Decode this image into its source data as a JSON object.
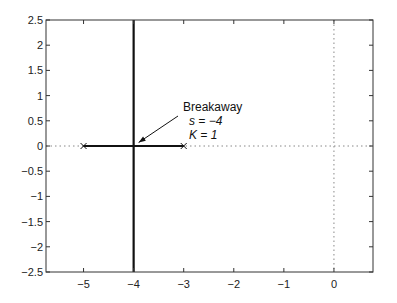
{
  "chart_data": {
    "type": "line",
    "title": "",
    "xlabel": "",
    "ylabel": "",
    "xlim": [
      -5.75,
      0.78
    ],
    "ylim": [
      -2.5,
      2.5
    ],
    "grid": false,
    "x_ticks": [
      -5,
      -4,
      -3,
      -2,
      -1,
      0
    ],
    "x_tick_labels": [
      "−5",
      "−4",
      "−3",
      "−2",
      "−1",
      "0"
    ],
    "y_ticks": [
      2.5,
      2,
      1.5,
      1,
      0.5,
      0,
      -0.5,
      -1,
      -1.5,
      -2,
      -2.5
    ],
    "y_tick_labels": [
      "2.5",
      "2",
      "1.5",
      "1",
      "0.5",
      "0",
      "−0.5",
      "−1",
      "−1.5",
      "−2",
      "−2.5"
    ],
    "series": [
      {
        "name": "root locus real-axis segment",
        "x": [
          -5,
          -3
        ],
        "y": [
          0,
          0
        ],
        "style": "solid-thick"
      },
      {
        "name": "root locus vertical asymptote branch",
        "x": [
          -4,
          -4
        ],
        "y": [
          -2.5,
          2.5
        ],
        "style": "solid-thick"
      }
    ],
    "open_loop_poles": [
      {
        "x": -5,
        "y": 0,
        "marker": "x"
      },
      {
        "x": -3,
        "y": 0,
        "marker": "x"
      }
    ],
    "reference_lines": [
      {
        "orientation": "horizontal",
        "value": 0,
        "style": "dotted"
      },
      {
        "orientation": "vertical",
        "value": 0,
        "style": "dotted"
      }
    ],
    "annotations": [
      {
        "lines": [
          "Breakaway",
          "s = −4",
          "K = 1"
        ],
        "text_x": -3.3,
        "text_y": 0.95,
        "arrow_to": {
          "x": -3.9,
          "y": 0.03
        }
      }
    ]
  },
  "annotation": {
    "line1": "Breakaway",
    "line2": "s = −4",
    "line3": "K = 1"
  },
  "colors": {
    "axes": "#333333",
    "locus": "#111111",
    "reference": "#888888"
  }
}
